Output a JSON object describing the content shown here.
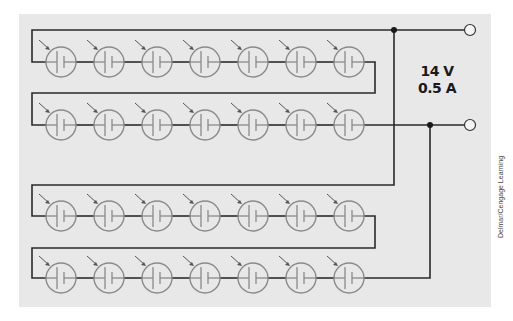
{
  "diagram": {
    "supply_voltage": "14 V",
    "supply_current": "0.5 A",
    "credit": "Delmar/Cengage Learning",
    "colors": {
      "panel": "#e8e8e8",
      "wire": "#2a2a2a",
      "lamp": "#8a8a8a"
    },
    "lamps_per_row": 7,
    "rows": 4,
    "total_lamps": 28,
    "terminals": [
      "positive-terminal",
      "negative-terminal"
    ]
  }
}
